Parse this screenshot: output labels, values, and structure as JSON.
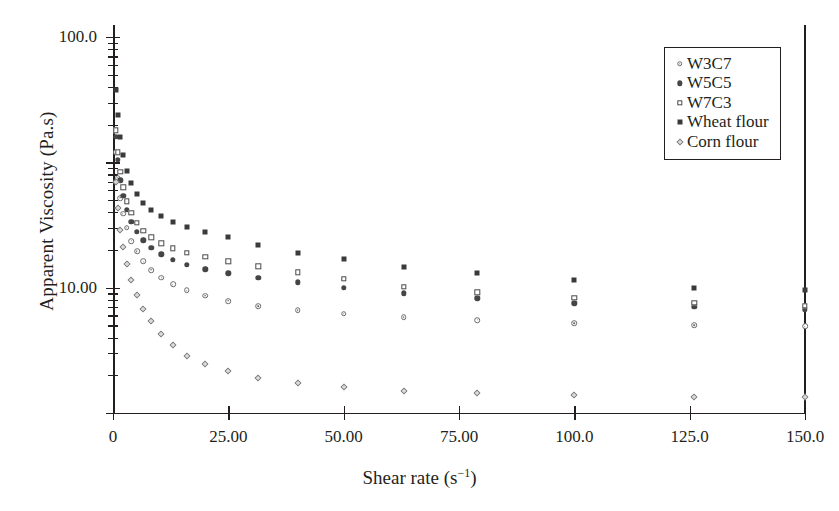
{
  "chart_data": {
    "type": "scatter",
    "title": "",
    "xlabel": "Shear rate (s⁻¹)",
    "ylabel": "Apparent Viscosity (Pa.s)",
    "xlim": [
      0,
      150
    ],
    "ylim": [
      0.1,
      100
    ],
    "yscale": "log",
    "xscale": "linear",
    "grid": false,
    "legend_position": "top-right",
    "xticks": [
      "0",
      "25.00",
      "50.00",
      "75.00",
      "100.0",
      "125.0",
      "150.0"
    ],
    "xtick_values": [
      0,
      25,
      50,
      75,
      100,
      125,
      150
    ],
    "yticks": [
      "100.0",
      "10.00",
      "1.000",
      "0.1000"
    ],
    "ytick_values": [
      100,
      10,
      1,
      0.1
    ],
    "series": [
      {
        "name": "W3C7",
        "marker": "dotted-circle",
        "color": "#6a6a6a",
        "x": [
          0.6,
          1.0,
          1.6,
          2.2,
          3.0,
          4.0,
          5.2,
          6.6,
          8.3,
          10.5,
          13.0,
          16.0,
          20.0,
          25.0,
          31.5,
          40.0,
          50.0,
          63.0,
          79.0,
          100.0,
          126.0,
          150.0
        ],
        "y": [
          12.0,
          7.5,
          5.2,
          3.9,
          3.0,
          2.35,
          1.95,
          1.62,
          1.38,
          1.2,
          1.06,
          0.95,
          0.86,
          0.78,
          0.71,
          0.66,
          0.62,
          0.58,
          0.55,
          0.52,
          0.5,
          0.49
        ]
      },
      {
        "name": "W5C5",
        "marker": "filled-circle",
        "color": "#454545",
        "x": [
          0.6,
          1.0,
          1.6,
          2.2,
          3.0,
          4.0,
          5.2,
          6.6,
          8.3,
          10.5,
          13.0,
          16.0,
          20.0,
          25.0,
          31.5,
          40.0,
          50.0,
          63.0,
          79.0,
          100.0,
          126.0,
          150.0
        ],
        "y": [
          16.0,
          10.5,
          7.2,
          5.4,
          4.2,
          3.35,
          2.8,
          2.38,
          2.07,
          1.84,
          1.66,
          1.52,
          1.4,
          1.3,
          1.2,
          1.1,
          1.0,
          0.9,
          0.82,
          0.75,
          0.7,
          0.67
        ]
      },
      {
        "name": "W7C3",
        "marker": "open-square",
        "color": "#4a4a4a",
        "x": [
          0.6,
          1.0,
          1.6,
          2.2,
          3.0,
          4.0,
          5.2,
          6.6,
          8.3,
          10.5,
          13.0,
          16.0,
          20.0,
          25.0,
          31.5,
          40.0,
          50.0,
          63.0,
          79.0,
          100.0,
          126.0,
          150.0
        ],
        "y": [
          18.0,
          12.0,
          8.4,
          6.3,
          4.9,
          3.95,
          3.3,
          2.85,
          2.52,
          2.26,
          2.06,
          1.9,
          1.76,
          1.62,
          1.48,
          1.33,
          1.18,
          1.02,
          0.92,
          0.83,
          0.76,
          0.72
        ]
      },
      {
        "name": "Wheat flour",
        "marker": "filled-square",
        "color": "#3a3a3a",
        "x": [
          0.6,
          1.0,
          1.6,
          2.2,
          3.0,
          4.0,
          5.2,
          6.6,
          8.3,
          10.5,
          13.0,
          16.0,
          20.0,
          25.0,
          31.5,
          40.0,
          50.0,
          63.0,
          79.0,
          100.0,
          126.0,
          150.0
        ],
        "y": [
          38.0,
          24.0,
          16.0,
          11.5,
          8.6,
          6.8,
          5.6,
          4.75,
          4.15,
          3.7,
          3.35,
          3.05,
          2.8,
          2.55,
          2.2,
          1.9,
          1.7,
          1.45,
          1.32,
          1.15,
          1.0,
          0.95
        ]
      },
      {
        "name": "Corn flour",
        "marker": "diamond",
        "color": "#777777",
        "x": [
          0.6,
          1.0,
          1.6,
          2.2,
          3.0,
          4.0,
          5.2,
          6.6,
          8.3,
          10.5,
          13.0,
          16.0,
          20.0,
          25.0,
          31.5,
          40.0,
          50.0,
          63.0,
          79.0,
          100.0,
          126.0,
          150.0
        ],
        "y": [
          7.0,
          4.3,
          2.9,
          2.1,
          1.55,
          1.15,
          0.88,
          0.68,
          0.54,
          0.43,
          0.35,
          0.285,
          0.245,
          0.215,
          0.19,
          0.175,
          0.16,
          0.15,
          0.145,
          0.14,
          0.135,
          0.135
        ]
      }
    ]
  },
  "legend": {
    "items": [
      {
        "label": "W3C7",
        "marker": "dotted-circle"
      },
      {
        "label": "W5C5",
        "marker": "filled-circle"
      },
      {
        "label": "W7C3",
        "marker": "open-square"
      },
      {
        "label": "Wheat flour",
        "marker": "filled-square"
      },
      {
        "label": "Corn flour",
        "marker": "diamond"
      }
    ]
  }
}
